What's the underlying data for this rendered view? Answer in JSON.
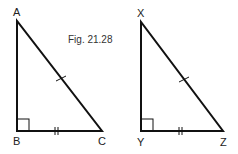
{
  "figure": {
    "caption": "Fig. 21.28"
  },
  "triangles": [
    {
      "name": "ABC",
      "vertices": {
        "top": "A",
        "right_angle": "B",
        "base_end": "C"
      },
      "right_angle_at": "B",
      "marks": {
        "hypotenuse": "single tick",
        "base": "double tick"
      }
    },
    {
      "name": "XYZ",
      "vertices": {
        "top": "X",
        "right_angle": "Y",
        "base_end": "Z"
      },
      "right_angle_at": "Y",
      "marks": {
        "hypotenuse": "single tick",
        "base": "double tick"
      }
    }
  ],
  "labels": {
    "A": "A",
    "B": "B",
    "C": "C",
    "X": "X",
    "Y": "Y",
    "Z": "Z"
  },
  "colors": {
    "stroke": "#111111",
    "background": "#ffffff"
  }
}
